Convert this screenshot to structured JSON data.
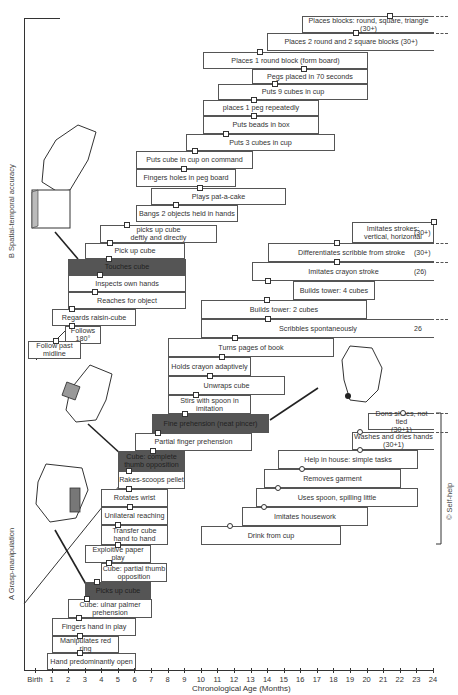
{
  "chart_data": {
    "type": "developmental-milestone-staircase",
    "title": "",
    "xlabel": "Chronological Age (Months)",
    "x_ticks": [
      "Birth",
      "1",
      "2",
      "3",
      "4",
      "5",
      "6",
      "7",
      "8",
      "9",
      "10",
      "11",
      "12",
      "13",
      "14",
      "15",
      "16",
      "17",
      "18",
      "19",
      "20",
      "21",
      "22",
      "23",
      "24"
    ],
    "xlim": [
      0,
      24
    ],
    "sections": [
      {
        "id": "B",
        "label": "Spatial-temporal accuracy",
        "items": [
          {
            "label": "Places blocks: round, square, triangle (30+)",
            "start": 21,
            "end": 24,
            "marker": 21.5,
            "open_end": true
          },
          {
            "label": "Places 2 round and 2 square blocks (30+)",
            "start": 19,
            "end": 24,
            "marker": 19.5,
            "open_end": true
          },
          {
            "label": "Places 1 round block (form board)",
            "start": 12,
            "end": 22,
            "marker": 15
          },
          {
            "label": "Pegs placed in 70 seconds",
            "start": 15,
            "end": 22,
            "marker": 18
          },
          {
            "label": "Puts 9 cubes in cup",
            "start": 13,
            "end": 22,
            "marker": 16
          },
          {
            "label": "places 1 peg repeatedly",
            "start": 12,
            "end": 19,
            "marker": 15
          },
          {
            "label": "Puts beads in box",
            "start": 12,
            "end": 19,
            "marker": 15
          },
          {
            "label": "Puts 3 cubes in cup",
            "start": 10,
            "end": 18,
            "marker": 12
          },
          {
            "label": "Puts cube in cup on command",
            "start": 7,
            "end": 14,
            "marker": 10
          },
          {
            "label": "Fingers holes in peg board",
            "start": 7,
            "end": 12,
            "marker": 9
          },
          {
            "label": "Plays pat-a-cake",
            "start": 8,
            "end": 14,
            "marker": 10
          },
          {
            "label": "Bangs 2 objects held in hands",
            "start": 7,
            "end": 12,
            "marker": 8
          },
          {
            "label": "picks up cube deftly and directly",
            "start": 6,
            "end": 10,
            "marker": 7.5
          },
          {
            "label": "Pick up cube",
            "start": 4,
            "end": 8,
            "marker": 5
          },
          {
            "label": "Touches cube",
            "start": 2.5,
            "end": 7,
            "marker": 5,
            "highlight": true
          },
          {
            "label": "Inspects own hands",
            "start": 2.5,
            "end": 7,
            "marker": 5
          },
          {
            "label": "Reaches for object",
            "start": 2.5,
            "end": 7,
            "marker": 4.5
          },
          {
            "label": "Regards raisin-cube",
            "start": 1.5,
            "end": 6,
            "marker": 3
          },
          {
            "label": "Follows 180°",
            "start": 2.5,
            "end": 4,
            "marker": 3
          },
          {
            "label": "Follow past midline",
            "start": 0,
            "end": 2.5,
            "marker": 1.5
          }
        ]
      },
      {
        "id": "A",
        "label": "Grasp-manipulation",
        "items": [
          {
            "label": "Imitates strokes: vertical, horizontal",
            "start": 18,
            "end": 24,
            "marker": 24,
            "tail": "(30+)"
          },
          {
            "label": "Differentiates scribble from stroke",
            "start": 13,
            "end": 24,
            "marker": 18,
            "tail": "(30+)",
            "open_end": true
          },
          {
            "label": "Imitates crayon stroke",
            "start": 12,
            "end": 24,
            "marker": 17,
            "tail": "(26)",
            "open_end": true
          },
          {
            "label": "Builds tower: 4 cubes",
            "start": 14,
            "end": 19,
            "marker": 15
          },
          {
            "label": "Builds tower: 2 cubes",
            "start": 10,
            "end": 18,
            "marker": 14
          },
          {
            "label": "Scribbles spontaneously",
            "start": 10,
            "end": 24,
            "marker": 14,
            "tail": "26",
            "open_end": true
          },
          {
            "label": "Turns pages of book",
            "start": 8,
            "end": 18,
            "marker": 12
          },
          {
            "label": "Holds crayon adaptively",
            "start": 8,
            "end": 13,
            "marker": 11
          },
          {
            "label": "Unwraps cube",
            "start": 8,
            "end": 16,
            "marker": 10
          },
          {
            "label": "Stirs with spoon in imitation",
            "start": 8,
            "end": 13,
            "marker": 9
          },
          {
            "label": "Fine prehension (neat pincer)",
            "start": 6,
            "end": 12,
            "marker": 9,
            "highlight": true
          },
          {
            "label": "Partial finger prehension",
            "start": 5,
            "end": 9,
            "marker": 7
          },
          {
            "label": "Cube: complete thumb opposition",
            "start": 4,
            "end": 7,
            "marker": 6,
            "highlight": true
          },
          {
            "label": "Rakes-scoops pellet",
            "start": 4,
            "end": 7,
            "marker": 6
          },
          {
            "label": "Rotates wrist",
            "start": 3,
            "end": 6,
            "marker": 4
          },
          {
            "label": "Unilateral reaching",
            "start": 3,
            "end": 6,
            "marker": 4
          },
          {
            "label": "Transfer cube hand to hand",
            "start": 3,
            "end": 6,
            "marker": 4
          },
          {
            "label": "Exploitive paper play",
            "start": 3,
            "end": 6,
            "marker": 4
          },
          {
            "label": "Cube: partial thumb opposition",
            "start": 3,
            "end": 6,
            "marker": 4
          },
          {
            "label": "Picks up cube",
            "start": 3,
            "end": 6,
            "marker": 4,
            "highlight": true
          },
          {
            "label": "Cube: ulnar palmer prehension",
            "start": 2,
            "end": 6,
            "marker": 3
          },
          {
            "label": "Fingers hand in play",
            "start": 1,
            "end": 6,
            "marker": 2.5
          },
          {
            "label": "Manipulates red ring",
            "start": 1,
            "end": 5,
            "marker": 2.5
          },
          {
            "label": "Hand predominantly open",
            "start": 0.5,
            "end": 6,
            "marker": 2.5
          }
        ]
      },
      {
        "id": "C",
        "label": "Self-help",
        "items": [
          {
            "label": "Dons shoes, not tied (30+1)",
            "start": 21,
            "end": 24,
            "marker": 22,
            "open_end": true
          },
          {
            "label": "Washes and dries hands (30+1)",
            "start": 18,
            "end": 24,
            "marker": 21,
            "open_end": true
          },
          {
            "label": "Help in house: simple tasks",
            "start": 15,
            "end": 24,
            "marker": 19
          },
          {
            "label": "Removes garment",
            "start": 14,
            "end": 22,
            "marker": 16
          },
          {
            "label": "Uses spoon, spilling little",
            "start": 13,
            "end": 24,
            "marker": 15
          },
          {
            "label": "Imitates housework",
            "start": 12,
            "end": 20,
            "marker": 14
          },
          {
            "label": "Drink from cup",
            "start": 10,
            "end": 19,
            "marker": 12
          }
        ]
      }
    ]
  },
  "sections": {
    "b_label": "B  Spatial-temporal accuracy",
    "a_label": "A  Grasp-manipulation",
    "c_label": "©  Self-help"
  },
  "axis": {
    "title": "Chronological Age (Months)",
    "ticks": [
      "Birth",
      "1",
      "2",
      "3",
      "4",
      "5",
      "6",
      "7",
      "8",
      "9",
      "10",
      "11",
      "12",
      "13",
      "14",
      "15",
      "16",
      "17",
      "18",
      "19",
      "20",
      "21",
      "22",
      "23",
      "24"
    ]
  },
  "boxes": [
    {
      "id": "b1",
      "x": 302,
      "y": 16,
      "w": 132,
      "h": 17,
      "t": "Places blocks: round, square, triangle (30+)",
      "m": 390,
      "open": true
    },
    {
      "id": "b2",
      "x": 267,
      "y": 33,
      "w": 167,
      "h": 18,
      "t": "Places 2 round and 2 square blocks (30+)",
      "m": 356,
      "open": true
    },
    {
      "id": "b3",
      "x": 203,
      "y": 52,
      "w": 165,
      "h": 17,
      "t": "Places 1 round block (form board)",
      "m": 260
    },
    {
      "id": "b4",
      "x": 252,
      "y": 69,
      "w": 116,
      "h": 15,
      "t": "Pegs placed in 70 seconds",
      "m": 304
    },
    {
      "id": "b5",
      "x": 218,
      "y": 84,
      "w": 150,
      "h": 16,
      "t": "Puts 9 cubes in cup",
      "m": 275
    },
    {
      "id": "b6",
      "x": 203,
      "y": 100,
      "w": 116,
      "h": 16,
      "t": "places 1 peg repeatedly",
      "m": 254
    },
    {
      "id": "b7",
      "x": 203,
      "y": 116,
      "w": 116,
      "h": 18,
      "t": "Puts beads in box",
      "m": 254
    },
    {
      "id": "b8",
      "x": 186,
      "y": 134,
      "w": 149,
      "h": 17,
      "t": "Puts 3 cubes in cup",
      "m": 226
    },
    {
      "id": "b9",
      "x": 136,
      "y": 151,
      "w": 117,
      "h": 18,
      "t": "Puts cube in cup on command",
      "m": 195
    },
    {
      "id": "b10",
      "x": 136,
      "y": 169,
      "w": 100,
      "h": 18,
      "t": "Fingers holes in peg board",
      "m": 184
    },
    {
      "id": "b11",
      "x": 151,
      "y": 188,
      "w": 135,
      "h": 17,
      "t": "Plays pat-a-cake",
      "m": 200
    },
    {
      "id": "b12",
      "x": 136,
      "y": 205,
      "w": 102,
      "h": 17,
      "t": "Bangs 2 objects held in hands",
      "m": 176
    },
    {
      "id": "b13",
      "x": 100,
      "y": 225,
      "w": 117,
      "h": 18,
      "t": "picks up cube\ndeftly and directly",
      "m": 127
    },
    {
      "id": "b14",
      "x": 85,
      "y": 243,
      "w": 100,
      "h": 16,
      "t": "Pick up cube",
      "m": 110
    },
    {
      "id": "b15",
      "x": 68,
      "y": 259,
      "w": 118,
      "h": 16,
      "t": "Touches cube",
      "m": 109,
      "dark": true
    },
    {
      "id": "b16",
      "x": 68,
      "y": 275,
      "w": 118,
      "h": 17,
      "t": "Inspects own hands",
      "m": 100
    },
    {
      "id": "b17",
      "x": 68,
      "y": 292,
      "w": 118,
      "h": 17,
      "t": "Reaches for object",
      "m": 95
    },
    {
      "id": "b18",
      "x": 52,
      "y": 309,
      "w": 84,
      "h": 17,
      "t": "Regards raisin-cube",
      "m": 72
    },
    {
      "id": "b19",
      "x": 65,
      "y": 326,
      "w": 36,
      "h": 18,
      "t": "Follows\n180°",
      "m": 72
    },
    {
      "id": "b20",
      "x": 28,
      "y": 341,
      "w": 53,
      "h": 18,
      "t": "Follow past\nmidline",
      "m": 56
    },
    {
      "id": "g1",
      "x": 352,
      "y": 222,
      "w": 82,
      "h": 21,
      "t": "Imitates strokes:\nvertical, horizontal",
      "m": 434,
      "tail": "(30+)"
    },
    {
      "id": "g2",
      "x": 268,
      "y": 243,
      "w": 166,
      "h": 19,
      "t": "Differentiates scribble from stroke",
      "m": 337,
      "tail": "(30+)",
      "open": true
    },
    {
      "id": "g3",
      "x": 252,
      "y": 262,
      "w": 182,
      "h": 19,
      "t": "Imitates crayon stroke",
      "m": 337,
      "tail": "(26)",
      "open": true
    },
    {
      "id": "g4",
      "x": 293,
      "y": 281,
      "w": 82,
      "h": 19,
      "t": "Builds tower: 4 cubes",
      "m": 268
    },
    {
      "id": "g5",
      "x": 201,
      "y": 300,
      "w": 166,
      "h": 19,
      "t": "Builds tower: 2 cubes",
      "m": 267
    },
    {
      "id": "g6",
      "x": 201,
      "y": 319,
      "w": 233,
      "h": 19,
      "t": "Scribbles spontaneously",
      "m": 268,
      "tail": "26",
      "open": true
    },
    {
      "id": "g7",
      "x": 168,
      "y": 338,
      "w": 166,
      "h": 19,
      "t": "Turns pages of book",
      "m": 235
    },
    {
      "id": "g8",
      "x": 168,
      "y": 357,
      "w": 83,
      "h": 19,
      "t": "Holds crayon adaptively",
      "m": 222
    },
    {
      "id": "g9",
      "x": 168,
      "y": 376,
      "w": 117,
      "h": 19,
      "t": "Unwraps cube",
      "m": 210
    },
    {
      "id": "g10",
      "x": 168,
      "y": 395,
      "w": 83,
      "h": 19,
      "t": "Stirs with spoon in imitation",
      "m": 196
    },
    {
      "id": "g11",
      "x": 152,
      "y": 414,
      "w": 117,
      "h": 19,
      "t": "Fine prehension (neat pincer)",
      "m": 185,
      "dark": true
    },
    {
      "id": "g12",
      "x": 135,
      "y": 433,
      "w": 117,
      "h": 18,
      "t": "Partial finger prehension",
      "m": 158
    },
    {
      "id": "g13",
      "x": 118,
      "y": 451,
      "w": 67,
      "h": 20,
      "t": "Cube: complete\nthumb opposition",
      "m": 153,
      "dark": true
    },
    {
      "id": "g14",
      "x": 118,
      "y": 471,
      "w": 67,
      "h": 18,
      "t": "Rakes-scoops pellet",
      "m": 129
    },
    {
      "id": "g15",
      "x": 101,
      "y": 489,
      "w": 67,
      "h": 18,
      "t": "Rotates wrist",
      "m": 129
    },
    {
      "id": "g16",
      "x": 101,
      "y": 507,
      "w": 67,
      "h": 18,
      "t": "Unilateral reaching",
      "m": 130
    },
    {
      "id": "g17",
      "x": 101,
      "y": 525,
      "w": 67,
      "h": 20,
      "t": "Transfer cube\nhand to hand",
      "m": 118
    },
    {
      "id": "g18",
      "x": 85,
      "y": 545,
      "w": 66,
      "h": 18,
      "t": "Exploitive paper play",
      "m": 118
    },
    {
      "id": "g19",
      "x": 101,
      "y": 563,
      "w": 66,
      "h": 19,
      "t": "Cube: partial thumb\nopposition",
      "m": 109
    },
    {
      "id": "g20",
      "x": 85,
      "y": 582,
      "w": 66,
      "h": 17,
      "t": "Picks up cube",
      "m": 97,
      "dark": true
    },
    {
      "id": "g21",
      "x": 68,
      "y": 599,
      "w": 84,
      "h": 19,
      "t": "Cube: ulnar palmer\nprehension",
      "m": 87
    },
    {
      "id": "g22",
      "x": 52,
      "y": 618,
      "w": 84,
      "h": 18,
      "t": "Fingers hand in play",
      "m": 79
    },
    {
      "id": "g23",
      "x": 52,
      "y": 636,
      "w": 67,
      "h": 17,
      "t": "Manipulates red ring",
      "m": 80
    },
    {
      "id": "g24",
      "x": 47,
      "y": 653,
      "w": 89,
      "h": 17,
      "t": "Hand predominantly open",
      "m": 80
    },
    {
      "id": "s1",
      "x": 368,
      "y": 413,
      "w": 66,
      "h": 17,
      "t": "Dons shoes, not tied\n(30+1)",
      "m": 403,
      "open": true,
      "circle": true
    },
    {
      "id": "s2",
      "x": 352,
      "y": 432,
      "w": 82,
      "h": 18,
      "t": "Washes and dries hands\n(30+1)",
      "m": 360,
      "open": true,
      "circle": true
    },
    {
      "id": "s3",
      "x": 278,
      "y": 450,
      "w": 140,
      "h": 19,
      "t": "Help in house: simple tasks",
      "m": 360,
      "circle": true
    },
    {
      "id": "s4",
      "x": 264,
      "y": 469,
      "w": 137,
      "h": 19,
      "t": "Removes garment",
      "m": 302,
      "circle": true
    },
    {
      "id": "s5",
      "x": 256,
      "y": 488,
      "w": 162,
      "h": 19,
      "t": "Uses spoon, spilling little",
      "m": 278,
      "circle": true
    },
    {
      "id": "s6",
      "x": 242,
      "y": 507,
      "w": 126,
      "h": 19,
      "t": "Imitates housework",
      "m": 264,
      "circle": true
    },
    {
      "id": "s7",
      "x": 201,
      "y": 526,
      "w": 140,
      "h": 19,
      "t": "Drink from cup",
      "m": 230,
      "circle": true
    }
  ]
}
